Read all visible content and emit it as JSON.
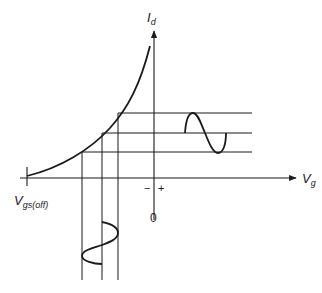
{
  "diagram": {
    "y_axis": {
      "label_main": "I",
      "label_sub": "d"
    },
    "x_axis": {
      "label_main": "V",
      "label_sub": "g"
    },
    "pinchoff_label": {
      "main": "V",
      "sub": "gs(off)"
    },
    "origin_label": "0",
    "minus_sign": "−",
    "plus_sign": "+",
    "colors": {
      "line": "#1a1a1a",
      "background": "#ffffff"
    },
    "elements": [
      "transfer-curve",
      "input-sine-wave (vertical, below x-axis)",
      "output-sine-wave (horizontal, right of y-axis)",
      "three vertical projection lines",
      "three horizontal projection lines"
    ]
  }
}
